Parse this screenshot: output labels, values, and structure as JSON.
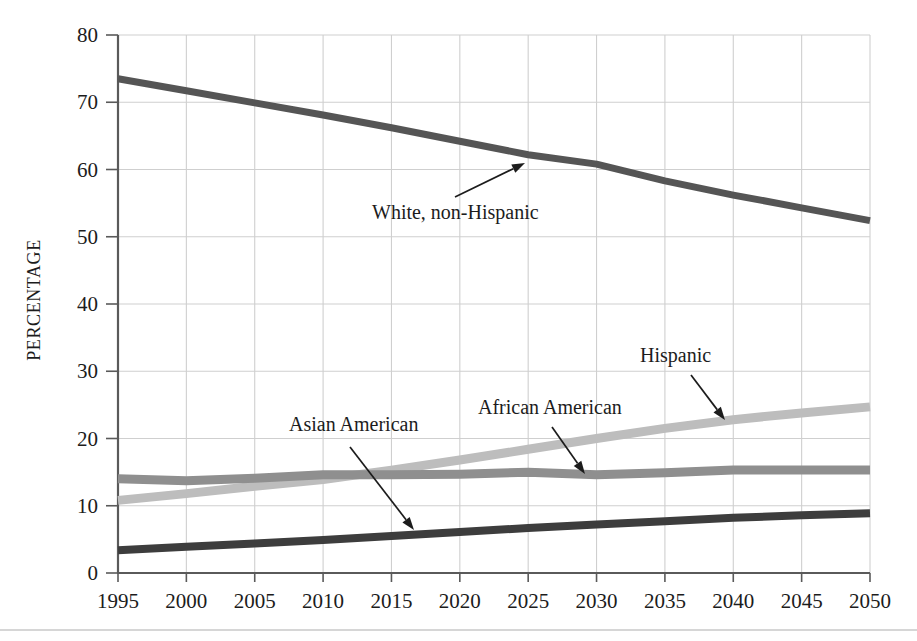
{
  "chart_data": {
    "type": "line",
    "title": "",
    "subtitle": "",
    "xlabel": "",
    "ylabel": "PERCENTAGE",
    "x": [
      1995,
      2000,
      2005,
      2010,
      2015,
      2020,
      2025,
      2030,
      2035,
      2040,
      2045,
      2050
    ],
    "categories": [
      "1995",
      "2000",
      "2005",
      "2010",
      "2015",
      "2020",
      "2025",
      "2030",
      "2035",
      "2040",
      "2045",
      "2050"
    ],
    "xlim": [
      1995,
      2050
    ],
    "ylim": [
      0,
      80
    ],
    "y_ticks": [
      0,
      10,
      20,
      30,
      40,
      50,
      60,
      70,
      80
    ],
    "y_tick_labels": [
      "0",
      "10",
      "20",
      "30",
      "40",
      "50",
      "60",
      "70",
      "80"
    ],
    "grid": "both",
    "legend_position": "inline-annotations",
    "series": [
      {
        "name": "White, non-Hispanic",
        "color": "#555555",
        "stroke_width": 7,
        "values": [
          73.5,
          71.7,
          69.9,
          68.1,
          66.2,
          64.2,
          62.2,
          60.8,
          58.3,
          56.2,
          54.3,
          52.4
        ]
      },
      {
        "name": "Hispanic",
        "color": "#bdbdbd",
        "stroke_width": 9,
        "values": [
          10.8,
          11.8,
          12.9,
          13.9,
          15.3,
          16.8,
          18.4,
          20.0,
          21.5,
          22.8,
          23.8,
          24.7
        ]
      },
      {
        "name": "African American",
        "color": "#8f8f8f",
        "stroke_width": 9,
        "values": [
          14.0,
          13.7,
          14.1,
          14.6,
          14.6,
          14.7,
          15.0,
          14.6,
          14.9,
          15.3,
          15.3,
          15.3
        ]
      },
      {
        "name": "Asian American",
        "color": "#3d3d3d",
        "stroke_width": 8,
        "values": [
          3.4,
          3.9,
          4.4,
          4.9,
          5.5,
          6.1,
          6.7,
          7.2,
          7.7,
          8.2,
          8.6,
          8.9
        ]
      }
    ],
    "annotations": [
      {
        "text": "White, non-Hispanic",
        "label_x": 372,
        "label_y": 219,
        "anchor": "start",
        "leader_from": [
          455,
          197
        ],
        "leader_to": [
          525,
          163
        ]
      },
      {
        "text": "Hispanic",
        "label_x": 640,
        "label_y": 362,
        "anchor": "start",
        "leader_from": [
          691,
          375
        ],
        "leader_to": [
          725,
          420
        ]
      },
      {
        "text": "African American",
        "label_x": 478,
        "label_y": 414,
        "anchor": "start",
        "leader_from": [
          552,
          427
        ],
        "leader_to": [
          585,
          474
        ]
      },
      {
        "text": "Asian American",
        "label_x": 289,
        "label_y": 431,
        "anchor": "start",
        "leader_from": [
          350,
          447
        ],
        "leader_to": [
          414,
          530
        ]
      }
    ]
  },
  "plot_geometry": {
    "left": 118,
    "right": 870,
    "top": 35,
    "bottom": 573
  },
  "colors": {
    "grid": "#cfcfcf",
    "axis": "#5a5a5a",
    "text": "#1c1c1c",
    "background": "#ffffff"
  }
}
